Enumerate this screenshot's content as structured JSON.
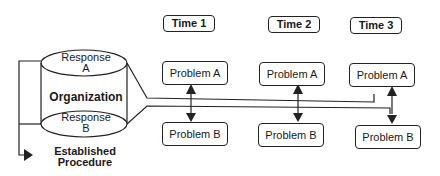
{
  "diagram": {
    "organization_label": "Organization",
    "response_a": "Response A",
    "response_a_line1": "Response",
    "response_a_line2": "A",
    "response_b_line1": "Response",
    "response_b_line2": "B",
    "established_line1": "Established",
    "established_line2": "Procedure",
    "times": [
      {
        "label": "Time 1",
        "problem_a": "Problem A",
        "problem_b": "Problem B"
      },
      {
        "label": "Time 2",
        "problem_a": "Problem A",
        "problem_b": "Problem B"
      },
      {
        "label": "Time 3",
        "problem_a": "Problem A",
        "problem_b": "Problem B"
      }
    ]
  }
}
